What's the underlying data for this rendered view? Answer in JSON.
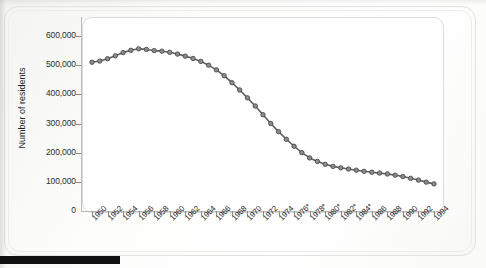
{
  "chart_data": {
    "type": "line",
    "title": "",
    "xlabel": "",
    "ylabel": "Number of residents",
    "ylim": [
      0,
      600000
    ],
    "xlim": [
      1950,
      1994
    ],
    "grid": false,
    "legend": false,
    "marker": "circle",
    "line_color": "#5f5f62",
    "marker_fill": "#8d8d90",
    "marker_edge": "#4a4a4d",
    "y_ticks": [
      0,
      100000,
      200000,
      300000,
      400000,
      500000,
      600000
    ],
    "y_tick_labels": [
      "0",
      "100,000",
      "200,000",
      "300,000",
      "400,000",
      "500,000",
      "600,000"
    ],
    "x_tick_labels": [
      "1950",
      "1952",
      "1954",
      "1956",
      "1958",
      "1960",
      "1962",
      "1964",
      "1966",
      "1968",
      "1970",
      "1972",
      "1974",
      "1976*",
      "1978*",
      "1980*",
      "1982*",
      "1984*",
      "1986",
      "1988",
      "1990",
      "1992",
      "1994"
    ],
    "x": [
      1950,
      1951,
      1952,
      1953,
      1954,
      1955,
      1956,
      1957,
      1958,
      1959,
      1960,
      1961,
      1962,
      1963,
      1964,
      1965,
      1966,
      1967,
      1968,
      1969,
      1970,
      1971,
      1972,
      1973,
      1974,
      1975,
      1976,
      1977,
      1978,
      1979,
      1980,
      1981,
      1982,
      1983,
      1984,
      1985,
      1986,
      1987,
      1988,
      1989,
      1990,
      1991,
      1992,
      1993,
      1994
    ],
    "values": [
      510000,
      514000,
      522000,
      532000,
      543000,
      551000,
      556000,
      554000,
      550000,
      548000,
      544000,
      538000,
      531000,
      523000,
      513000,
      500000,
      484000,
      464000,
      440000,
      415000,
      388000,
      360000,
      330000,
      300000,
      272000,
      246000,
      222000,
      200000,
      182000,
      170000,
      160000,
      153000,
      148000,
      144000,
      140000,
      136000,
      133000,
      130000,
      127000,
      123000,
      118000,
      112000,
      106000,
      99000,
      93000
    ]
  },
  "artifact": {
    "scan_bar": "black-scan-edge"
  }
}
